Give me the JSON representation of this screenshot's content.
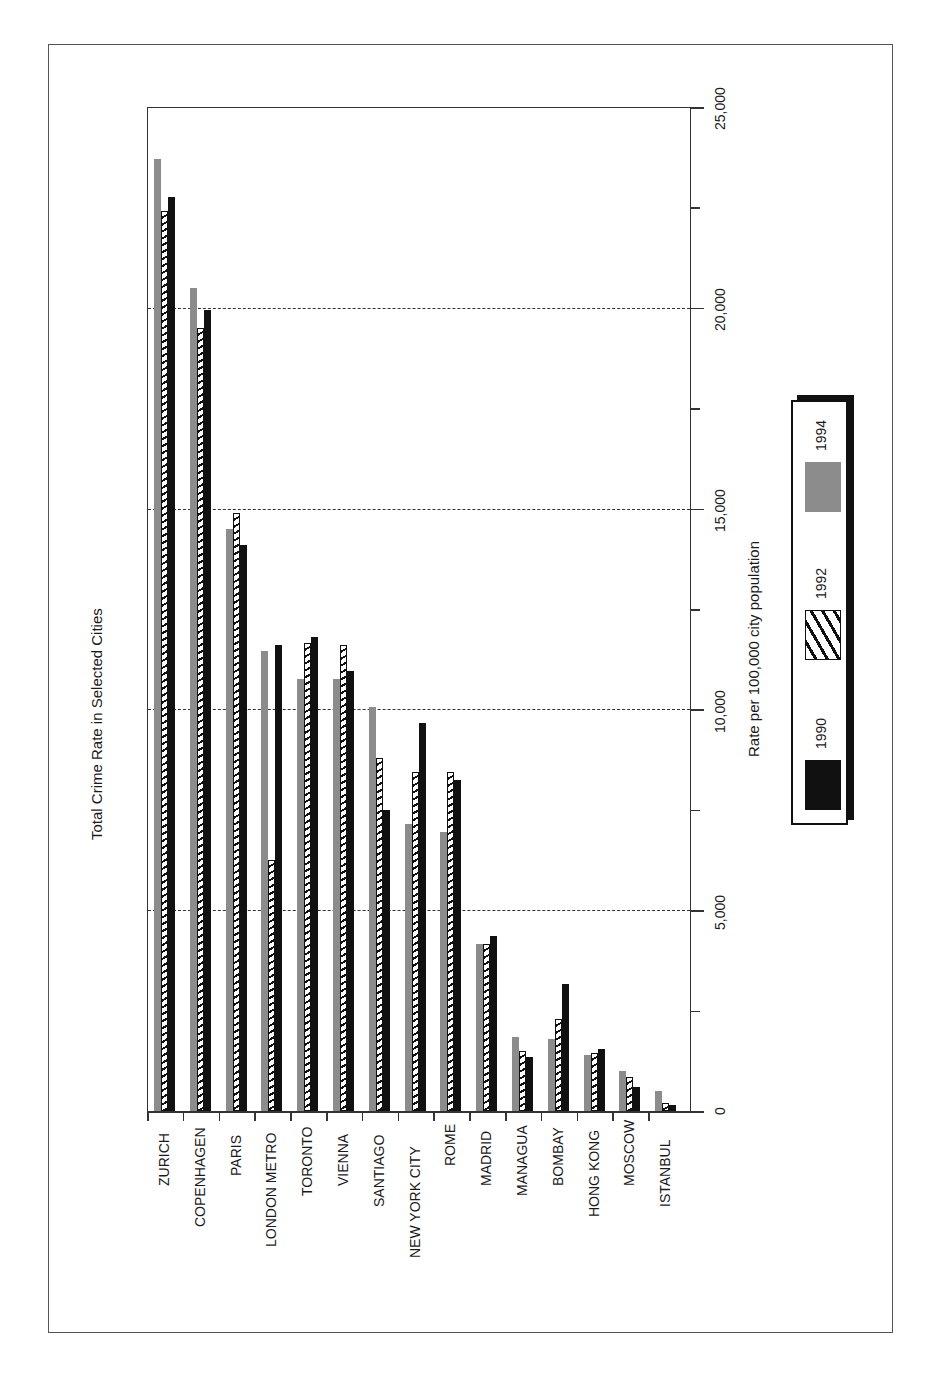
{
  "chart_data": {
    "type": "bar",
    "orientation": "rotated-90",
    "title": "Total Crime Rate in Selected Cities",
    "xlabel": "",
    "ylabel": "Rate per 100,000 city population",
    "ylim": [
      0,
      25000
    ],
    "yticks": [
      "0",
      "5,000",
      "10,000",
      "15,000",
      "20,000",
      "25,000"
    ],
    "grid": "dashed at 5,000 / 10,000 / 15,000 / 20,000",
    "legend_position": "right",
    "categories": [
      "ZURICH",
      "COPENHAGEN",
      "PARIS",
      "LONDON METRO",
      "TORONTO",
      "VIENNA",
      "SANTIAGO",
      "NEW YORK CITY",
      "ROME",
      "MADRID",
      "MANAGUA",
      "BOMBAY",
      "HONG KONG",
      "MOSCOW",
      "ISTANBUL"
    ],
    "series": [
      {
        "name": "1994",
        "style": "gray",
        "color": "#8c8c8c",
        "values": [
          23700,
          20500,
          14500,
          11450,
          10750,
          10750,
          10050,
          7150,
          6950,
          4150,
          1850,
          1800,
          1400,
          1000,
          500
        ]
      },
      {
        "name": "1992",
        "style": "hatched",
        "color": "#111111",
        "values": [
          22400,
          19500,
          14900,
          6250,
          11650,
          11600,
          8800,
          8450,
          8450,
          4150,
          1500,
          2300,
          1450,
          850,
          200
        ]
      },
      {
        "name": "1990",
        "style": "black",
        "color": "#111111",
        "values": [
          22750,
          19950,
          14100,
          11600,
          11800,
          10950,
          7500,
          9650,
          8250,
          4350,
          1350,
          3150,
          1550,
          600,
          150
        ]
      }
    ]
  },
  "legend": {
    "items": [
      "1990",
      "1992",
      "1994"
    ]
  }
}
